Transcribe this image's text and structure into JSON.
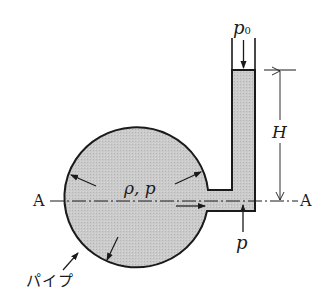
{
  "diagram": {
    "labels": {
      "p0_main": "p",
      "p0_sub": "0",
      "H": "H",
      "rho_p": "ρ,  p",
      "p_bottom": "p",
      "A_left": "A",
      "A_right": "A",
      "pipe": "パイプ"
    },
    "colors": {
      "fluid": "#c8c8c8",
      "stroke": "#1a1a1a",
      "background": "#ffffff"
    }
  }
}
